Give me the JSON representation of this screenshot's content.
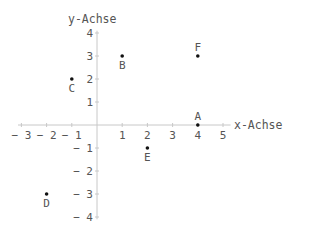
{
  "chart_data": {
    "type": "scatter",
    "title": "",
    "xlabel": "x-Achse",
    "ylabel": "y-Achse",
    "xlim": [
      -3,
      5
    ],
    "ylim": [
      -4,
      4
    ],
    "grid": false,
    "legend": null,
    "x_ticks": [
      -3,
      -2,
      -1,
      1,
      2,
      3,
      4,
      5
    ],
    "x_tick_labels": [
      "-3",
      "-2",
      "-1",
      "1",
      "2",
      "3",
      "4",
      "5"
    ],
    "y_ticks": [
      4,
      3,
      2,
      1,
      -1,
      -2,
      -3,
      -4
    ],
    "y_tick_labels": [
      "4",
      "3",
      "2",
      "1",
      "-1",
      "-2",
      "-3",
      "-4"
    ],
    "points": [
      {
        "label": "A",
        "x": 4,
        "y": 0,
        "label_pos": "above"
      },
      {
        "label": "B",
        "x": 1,
        "y": 3,
        "label_pos": "below"
      },
      {
        "label": "C",
        "x": -1,
        "y": 2,
        "label_pos": "below"
      },
      {
        "label": "D",
        "x": -2,
        "y": -3,
        "label_pos": "below"
      },
      {
        "label": "E",
        "x": 2,
        "y": -1,
        "label_pos": "below"
      },
      {
        "label": "F",
        "x": 4,
        "y": 3,
        "label_pos": "above"
      }
    ]
  },
  "colors": {
    "axis": "#c8c8c8",
    "text": "#555555",
    "point": "#111111"
  }
}
